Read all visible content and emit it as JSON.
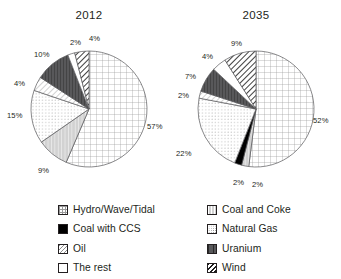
{
  "top_fragment": "",
  "charts": [
    {
      "id": "chart-2012",
      "title": "2012",
      "labels": [
        "57%",
        "9%",
        "15%",
        "4%",
        "10%",
        "2%",
        "4%"
      ]
    },
    {
      "id": "chart-2035",
      "title": "2035",
      "labels": [
        "52%",
        "2%",
        "2%",
        "22%",
        "2%",
        "7%",
        "4%",
        "9%"
      ]
    }
  ],
  "legend": {
    "left": [
      {
        "label": "Hydro/Wave/Tidal",
        "pattern": "grid",
        "swatch_class": "sw-hydro"
      },
      {
        "label": "Coal with CCS",
        "pattern": "solid-black",
        "swatch_class": "sw-ccs"
      },
      {
        "label": "Oil",
        "pattern": "diagonal-light",
        "swatch_class": "sw-oil"
      },
      {
        "label": "The rest",
        "pattern": "white",
        "swatch_class": "sw-rest"
      }
    ],
    "right": [
      {
        "label": "Coal and Coke",
        "pattern": "light-gray-vertical",
        "swatch_class": "sw-coalcoke"
      },
      {
        "label": "Natural Gas",
        "pattern": "dotted",
        "swatch_class": "sw-gas"
      },
      {
        "label": "Uranium",
        "pattern": "dark-gray-vertical",
        "swatch_class": "sw-uranium"
      },
      {
        "label": "Wind",
        "pattern": "diagonal-bold",
        "swatch_class": "sw-wind"
      }
    ]
  },
  "chart_data": [
    {
      "type": "pie",
      "title": "2012",
      "categories": [
        "Hydro/Wave/Tidal",
        "Coal and Coke",
        "Natural Gas",
        "Oil",
        "Uranium",
        "The rest",
        "Wind"
      ],
      "values": [
        57,
        9,
        15,
        4,
        10,
        2,
        4
      ],
      "value_labels": [
        "57%",
        "9%",
        "15%",
        "4%",
        "10%",
        "2%",
        "4%"
      ],
      "unit": "%",
      "start_angle_deg": 0,
      "direction": "clockwise",
      "legend_position": "bottom",
      "grid": false
    },
    {
      "type": "pie",
      "title": "2035",
      "categories": [
        "Hydro/Wave/Tidal",
        "Coal and Coke",
        "Coal with CCS",
        "Natural Gas",
        "Oil",
        "Uranium",
        "The rest",
        "Wind"
      ],
      "values": [
        52,
        2,
        2,
        22,
        2,
        7,
        4,
        9
      ],
      "value_labels": [
        "52%",
        "2%",
        "2%",
        "22%",
        "2%",
        "7%",
        "4%",
        "9%"
      ],
      "unit": "%",
      "start_angle_deg": 0,
      "direction": "clockwise",
      "legend_position": "bottom",
      "grid": false
    }
  ],
  "pie_slices": {
    "chart-2012": [
      {
        "name": "Hydro/Wave/Tidal",
        "value": 57,
        "label": "57%",
        "pattern": "grid",
        "label_x": 147,
        "label_y": 122
      },
      {
        "name": "Coal and Coke",
        "value": 9,
        "label": "9%",
        "pattern": "light-gray-vertical",
        "label_x": 38,
        "label_y": 166
      },
      {
        "name": "Natural Gas",
        "value": 15,
        "label": "15%",
        "pattern": "dotted",
        "label_x": 7,
        "label_y": 111
      },
      {
        "name": "Oil",
        "value": 4,
        "label": "4%",
        "pattern": "diagonal-light",
        "label_x": 14,
        "label_y": 79
      },
      {
        "name": "Uranium",
        "value": 10,
        "label": "10%",
        "pattern": "dark-gray-vertical",
        "label_x": 34,
        "label_y": 50
      },
      {
        "name": "The rest",
        "value": 2,
        "label": "2%",
        "pattern": "white",
        "label_x": 70,
        "label_y": 38
      },
      {
        "name": "Wind",
        "value": 4,
        "label": "4%",
        "pattern": "diagonal-bold",
        "label_x": 89,
        "label_y": 34
      }
    ],
    "chart-2035": [
      {
        "name": "Hydro/Wave/Tidal",
        "value": 52,
        "label": "52%",
        "pattern": "grid",
        "label_x": 313,
        "label_y": 116
      },
      {
        "name": "Coal and Coke",
        "value": 2,
        "label": "2%",
        "pattern": "light-gray-vertical",
        "label_x": 252,
        "label_y": 180
      },
      {
        "name": "Coal with CCS",
        "value": 2,
        "label": "2%",
        "pattern": "solid-black",
        "label_x": 233,
        "label_y": 178
      },
      {
        "name": "Natural Gas",
        "value": 22,
        "label": "22%",
        "pattern": "dotted",
        "label_x": 176,
        "label_y": 149
      },
      {
        "name": "Oil",
        "value": 2,
        "label": "2%",
        "pattern": "diagonal-light",
        "label_x": 178,
        "label_y": 91
      },
      {
        "name": "Uranium",
        "value": 7,
        "label": "7%",
        "pattern": "dark-gray-vertical",
        "label_x": 185,
        "label_y": 72
      },
      {
        "name": "The rest",
        "value": 4,
        "label": "4%",
        "pattern": "white",
        "label_x": 202,
        "label_y": 52
      },
      {
        "name": "Wind",
        "value": 9,
        "label": "9%",
        "pattern": "diagonal-bold",
        "label_x": 231,
        "label_y": 39
      }
    ]
  },
  "geometry": {
    "chart-2012": {
      "cx": 89,
      "cy": 109,
      "r": 58
    },
    "chart-2035": {
      "cx": 256,
      "cy": 109,
      "r": 58
    }
  },
  "colors": {
    "outline": "#58585a",
    "text": "#231f20",
    "black_slice": "#000000",
    "uranium_gray": "#58585a",
    "coal_coke_gray": "#d2d2d2",
    "background": "#ffffff"
  }
}
